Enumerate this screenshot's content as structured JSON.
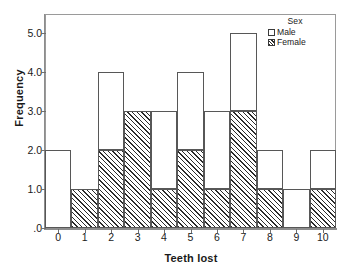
{
  "chart_data": {
    "type": "bar",
    "subtype": "stacked-histogram",
    "title": "",
    "xlabel": "Teeth lost",
    "ylabel": "Frequency",
    "categories": [
      "0",
      "1",
      "2",
      "3",
      "4",
      "5",
      "6",
      "7",
      "8",
      "9",
      "10"
    ],
    "series": [
      {
        "name": "Male",
        "values": [
          2,
          0,
          2,
          0,
          2,
          2,
          2,
          2,
          1,
          1,
          1
        ]
      },
      {
        "name": "Female",
        "values": [
          0,
          1,
          2,
          3,
          1,
          2,
          1,
          3,
          1,
          0,
          1
        ]
      }
    ],
    "totals": [
      2,
      1,
      4,
      3,
      3,
      4,
      3,
      5,
      2,
      1,
      2
    ],
    "ylim": [
      0,
      5.5
    ],
    "yticks": [
      0,
      1,
      2,
      3,
      4,
      5
    ],
    "ytick_labels": [
      ".0",
      "1.0",
      "2.0",
      "3.0",
      "4.0",
      "5.0"
    ],
    "xticks": [
      0,
      1,
      2,
      3,
      4,
      5,
      6,
      7,
      8,
      9,
      10
    ],
    "xtick_labels": [
      "0",
      "1",
      "2",
      "3",
      "4",
      "5",
      "6",
      "7",
      "8",
      "9",
      "10"
    ],
    "grid": false,
    "legend": {
      "position": "top-right",
      "title": "Sex",
      "entries": [
        {
          "label": "Male",
          "swatch": "open-white"
        },
        {
          "label": "Female",
          "swatch": "diagonal-hatch"
        }
      ]
    },
    "colors": {
      "male_fill": "#ffffff",
      "female_fill": "#ffffff",
      "female_hatch": "#2b2b2b",
      "bar_outline": "#575757",
      "axis": "#8d8d8d",
      "text": "#1a1a1a"
    }
  }
}
